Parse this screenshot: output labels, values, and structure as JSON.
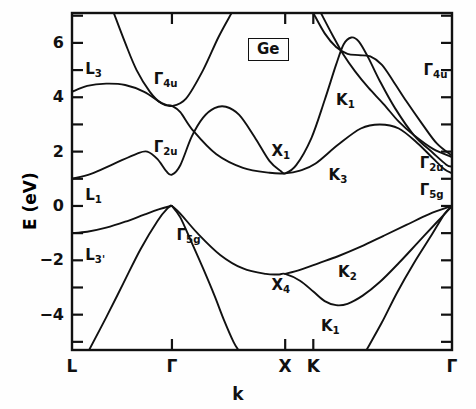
{
  "figure": {
    "material_label": "Ge",
    "xlabel": "k",
    "ylabel": "E (eV)"
  },
  "chart_data": {
    "type": "line",
    "title": "Ge",
    "xlabel": "k",
    "ylabel": "E (eV)",
    "ylim": [
      -5.3,
      7.1
    ],
    "grid": false,
    "legend": "none",
    "xtick_labels": [
      "L",
      "Γ",
      "X",
      "K",
      "Γ"
    ],
    "xtick_positions": [
      0.0,
      0.263,
      0.561,
      0.635,
      1.0
    ],
    "ytick_labels": [
      "6",
      "4",
      "2",
      "0",
      "−2",
      "−4"
    ],
    "ytick_values": [
      6,
      4,
      2,
      0,
      -2,
      -4
    ],
    "yminor_tick_values": [
      7,
      5,
      3,
      1,
      -1,
      -3,
      -5
    ],
    "annotations": [
      {
        "text": "L",
        "sub": "3",
        "x": 0.035,
        "y": 5.0
      },
      {
        "text": "L",
        "sub": "1",
        "x": 0.035,
        "y": 0.35
      },
      {
        "text": "L",
        "sub": "3'",
        "x": 0.035,
        "y": -1.85
      },
      {
        "text": "Γ",
        "sub": "4u",
        "x": 0.215,
        "y": 4.65
      },
      {
        "text": "Γ",
        "sub": "2u",
        "x": 0.215,
        "y": 2.15
      },
      {
        "text": "Γ",
        "sub": "5g",
        "x": 0.275,
        "y": -1.1
      },
      {
        "text": "X",
        "sub": "1",
        "x": 0.525,
        "y": 2.0
      },
      {
        "text": "X",
        "sub": "4",
        "x": 0.525,
        "y": -2.95
      },
      {
        "text": "K",
        "sub": "1",
        "x": 0.695,
        "y": 3.85
      },
      {
        "text": "K",
        "sub": "3",
        "x": 0.675,
        "y": 1.1
      },
      {
        "text": "K",
        "sub": "2",
        "x": 0.7,
        "y": -2.45
      },
      {
        "text": "K",
        "sub": "1",
        "x": 0.655,
        "y": -4.45
      },
      {
        "text": "Γ",
        "sub": "4u",
        "x": 0.925,
        "y": 4.95
      },
      {
        "text": "Γ",
        "sub": "2u",
        "x": 0.915,
        "y": 1.55
      },
      {
        "text": "Γ",
        "sub": "5g",
        "x": 0.915,
        "y": 0.55
      }
    ],
    "series": [
      {
        "name": "conduction-band-upper-L3",
        "points": [
          [
            0.0,
            4.2
          ],
          [
            0.04,
            4.42
          ],
          [
            0.09,
            4.5
          ],
          [
            0.14,
            4.45
          ],
          [
            0.19,
            4.2
          ],
          [
            0.228,
            3.85
          ],
          [
            0.248,
            3.72
          ],
          [
            0.263,
            3.68
          ],
          [
            0.285,
            3.45
          ],
          [
            0.32,
            2.75
          ],
          [
            0.38,
            1.9
          ],
          [
            0.45,
            1.4
          ],
          [
            0.52,
            1.22
          ],
          [
            0.561,
            1.2
          ],
          [
            0.6,
            1.3
          ],
          [
            0.64,
            1.55
          ],
          [
            0.7,
            2.25
          ],
          [
            0.76,
            2.85
          ],
          [
            0.81,
            3.0
          ],
          [
            0.86,
            2.85
          ],
          [
            0.91,
            2.3
          ],
          [
            0.95,
            1.75
          ],
          [
            0.98,
            1.35
          ],
          [
            1.0,
            1.2
          ]
        ]
      },
      {
        "name": "conduction-band-steep-left",
        "points": [
          [
            0.11,
            7.1
          ],
          [
            0.14,
            6.0
          ],
          [
            0.17,
            5.0
          ],
          [
            0.205,
            4.2
          ],
          [
            0.235,
            3.78
          ],
          [
            0.263,
            3.68
          ],
          [
            0.3,
            3.95
          ],
          [
            0.345,
            5.0
          ],
          [
            0.385,
            6.2
          ],
          [
            0.42,
            7.1
          ]
        ]
      },
      {
        "name": "conduction-band-gamma2u-valley",
        "points": [
          [
            0.0,
            1.0
          ],
          [
            0.05,
            1.18
          ],
          [
            0.11,
            1.55
          ],
          [
            0.17,
            1.92
          ],
          [
            0.198,
            2.0
          ],
          [
            0.225,
            1.72
          ],
          [
            0.248,
            1.28
          ],
          [
            0.263,
            1.15
          ],
          [
            0.285,
            1.5
          ],
          [
            0.315,
            2.55
          ],
          [
            0.345,
            3.25
          ],
          [
            0.375,
            3.6
          ],
          [
            0.405,
            3.65
          ],
          [
            0.44,
            3.35
          ],
          [
            0.48,
            2.55
          ],
          [
            0.52,
            1.65
          ],
          [
            0.55,
            1.28
          ],
          [
            0.561,
            1.2
          ],
          [
            0.59,
            1.5
          ],
          [
            0.63,
            2.5
          ],
          [
            0.665,
            3.9
          ],
          [
            0.695,
            5.2
          ],
          [
            0.715,
            5.95
          ],
          [
            0.735,
            6.2
          ],
          [
            0.755,
            6.05
          ],
          [
            0.78,
            5.45
          ],
          [
            0.81,
            4.6
          ],
          [
            0.85,
            3.6
          ],
          [
            0.9,
            2.6
          ],
          [
            0.95,
            1.95
          ],
          [
            0.985,
            1.52
          ],
          [
            1.0,
            1.45
          ]
        ]
      },
      {
        "name": "conduction-band-upper-right-a",
        "points": [
          [
            0.635,
            7.1
          ],
          [
            0.665,
            6.35
          ],
          [
            0.695,
            5.85
          ],
          [
            0.725,
            5.6
          ],
          [
            0.755,
            5.55
          ],
          [
            0.785,
            5.5
          ],
          [
            0.815,
            5.2
          ],
          [
            0.845,
            4.6
          ],
          [
            0.88,
            3.85
          ],
          [
            0.92,
            3.05
          ],
          [
            0.96,
            2.3
          ],
          [
            1.0,
            1.85
          ]
        ]
      },
      {
        "name": "conduction-band-upper-right-b",
        "points": [
          [
            0.655,
            7.1
          ],
          [
            0.685,
            6.3
          ],
          [
            0.715,
            5.55
          ],
          [
            0.745,
            4.95
          ],
          [
            0.78,
            4.35
          ],
          [
            0.82,
            3.75
          ],
          [
            0.86,
            3.1
          ],
          [
            0.9,
            2.6
          ],
          [
            0.95,
            2.1
          ],
          [
            1.0,
            1.8
          ]
        ]
      },
      {
        "name": "valence-band-heavy-hole-left",
        "points": [
          [
            0.0,
            -1.0
          ],
          [
            0.04,
            -0.95
          ],
          [
            0.09,
            -0.8
          ],
          [
            0.14,
            -0.58
          ],
          [
            0.19,
            -0.32
          ],
          [
            0.23,
            -0.12
          ],
          [
            0.255,
            -0.02
          ],
          [
            0.263,
            0.0
          ],
          [
            0.285,
            -0.28
          ],
          [
            0.33,
            -1.0
          ],
          [
            0.39,
            -1.8
          ],
          [
            0.45,
            -2.3
          ],
          [
            0.51,
            -2.5
          ],
          [
            0.545,
            -2.52
          ],
          [
            0.561,
            -2.5
          ],
          [
            0.6,
            -2.75
          ],
          [
            0.635,
            -3.15
          ],
          [
            0.665,
            -3.5
          ],
          [
            0.695,
            -3.65
          ],
          [
            0.725,
            -3.6
          ],
          [
            0.765,
            -3.3
          ],
          [
            0.81,
            -2.8
          ],
          [
            0.86,
            -2.1
          ],
          [
            0.91,
            -1.35
          ],
          [
            0.96,
            -0.6
          ],
          [
            1.0,
            0.0
          ]
        ]
      },
      {
        "name": "valence-band-light-hole",
        "points": [
          [
            0.561,
            -2.5
          ],
          [
            0.6,
            -2.35
          ],
          [
            0.65,
            -2.1
          ],
          [
            0.7,
            -1.85
          ],
          [
            0.76,
            -1.5
          ],
          [
            0.82,
            -1.1
          ],
          [
            0.88,
            -0.7
          ],
          [
            0.94,
            -0.3
          ],
          [
            1.0,
            0.0
          ]
        ]
      },
      {
        "name": "valence-band-split-off-left",
        "points": [
          [
            0.045,
            -5.3
          ],
          [
            0.09,
            -4.1
          ],
          [
            0.135,
            -2.85
          ],
          [
            0.18,
            -1.6
          ],
          [
            0.225,
            -0.55
          ],
          [
            0.252,
            -0.08
          ],
          [
            0.263,
            0.0
          ]
        ]
      },
      {
        "name": "valence-band-split-off-right-of-gamma",
        "points": [
          [
            0.263,
            0.0
          ],
          [
            0.285,
            -0.42
          ],
          [
            0.315,
            -1.35
          ],
          [
            0.345,
            -2.3
          ],
          [
            0.375,
            -3.3
          ],
          [
            0.4,
            -4.2
          ],
          [
            0.425,
            -5.0
          ],
          [
            0.438,
            -5.3
          ]
        ]
      },
      {
        "name": "valence-band-deep-right",
        "points": [
          [
            0.775,
            -5.3
          ],
          [
            0.815,
            -4.3
          ],
          [
            0.855,
            -3.2
          ],
          [
            0.9,
            -2.1
          ],
          [
            0.945,
            -1.1
          ],
          [
            0.98,
            -0.3
          ],
          [
            1.0,
            0.0
          ]
        ]
      }
    ]
  }
}
